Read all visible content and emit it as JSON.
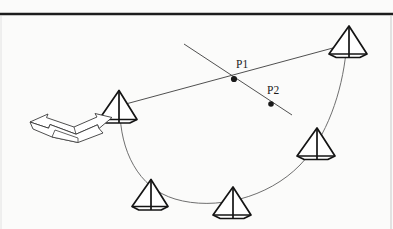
{
  "figure": {
    "background_color": "#fbfbfa",
    "top_rule": {
      "name": "top-horizontal-rule",
      "color": "#1c1c1c",
      "y": 14,
      "x1": 0,
      "x2": 393,
      "thickness": 2.4
    },
    "right_rule": {
      "name": "right-vertical-rule",
      "color": "#c9c9c9",
      "x": 391,
      "y1": 16,
      "y2": 229,
      "thickness": 1
    },
    "left_rule": {
      "name": "left-vertical-rule",
      "color": "#e2e2e2",
      "x": 1,
      "y1": 16,
      "y2": 229,
      "thickness": 1
    },
    "labels": [
      {
        "id": "P1",
        "text": "P1",
        "x": 236,
        "y": 68,
        "point_x": 234,
        "point_y": 79
      },
      {
        "id": "P2",
        "text": "P2",
        "x": 267,
        "y": 94,
        "point_x": 271,
        "point_y": 104
      }
    ],
    "points": [
      {
        "name": "point-p1",
        "x": 234,
        "y": 79,
        "radius": 3.1,
        "color": "#1a1a1a"
      },
      {
        "name": "point-p2",
        "x": 271,
        "y": 104,
        "radius": 2.8,
        "color": "#1a1a1a"
      }
    ],
    "lines": [
      {
        "name": "sight-line-main",
        "x1": 122,
        "y1": 105,
        "x2": 344,
        "y2": 45,
        "color": "#3c3c3c",
        "thickness": 0.9
      },
      {
        "name": "sight-line-cross",
        "x1": 184,
        "y1": 44,
        "x2": 292,
        "y2": 115,
        "color": "#3c3c3c",
        "thickness": 0.9
      }
    ],
    "arc": {
      "name": "trajectory-arc",
      "color": "#6f6f6f",
      "thickness": 1.0,
      "path": "M 120 110 C 120 150, 138 188, 175 199 C 215 211, 268 198, 300 165 C 327 137, 342 92, 346 52"
    },
    "pyramids": [
      {
        "id": "pyr-top-right",
        "name": "pyramid-marker-top-right",
        "cx": 348,
        "cy": 40,
        "half_width": 19,
        "height": 28,
        "apex_offset": 1
      },
      {
        "id": "pyr-left",
        "name": "pyramid-marker-left",
        "cx": 118,
        "cy": 105,
        "half_width": 19,
        "height": 29,
        "apex_offset": 1
      },
      {
        "id": "pyr-right-mid",
        "name": "pyramid-marker-right-mid",
        "cx": 316,
        "cy": 142,
        "half_width": 19,
        "height": 28,
        "apex_offset": 1
      },
      {
        "id": "pyr-bottom-left",
        "name": "pyramid-marker-bottom-left",
        "cx": 150,
        "cy": 193,
        "half_width": 18,
        "height": 27,
        "apex_offset": 1
      },
      {
        "id": "pyr-bottom-right",
        "name": "pyramid-marker-bottom-right",
        "cx": 232,
        "cy": 201,
        "half_width": 19,
        "height": 28,
        "apex_offset": 1
      }
    ],
    "arrow": {
      "name": "double-headed-arrow",
      "description": "3D bent double-headed arrow pointing left and right",
      "color": "#3a3a3a",
      "thickness": 0.9
    }
  }
}
